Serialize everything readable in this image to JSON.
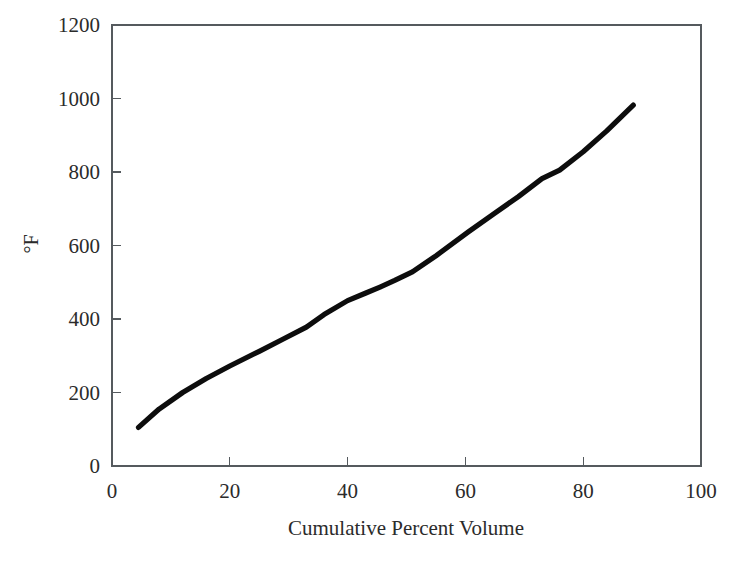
{
  "chart_data": {
    "type": "line",
    "title": "",
    "subtitle": "",
    "xlabel": "Cumulative Percent Volume",
    "ylabel": "°F",
    "xlim": [
      0,
      100
    ],
    "ylim": [
      0,
      1200
    ],
    "xticks": [
      0,
      20,
      40,
      60,
      80,
      100
    ],
    "yticks": [
      0,
      200,
      400,
      600,
      800,
      1000,
      1200
    ],
    "xtick_labels": [
      "0",
      "20",
      "40",
      "60",
      "80",
      "100"
    ],
    "ytick_labels": [
      "0",
      "200",
      "400",
      "600",
      "800",
      "1000",
      "1200"
    ],
    "grid": false,
    "legend": null,
    "series": [
      {
        "name": "Distillation curve",
        "color": "#0d0d0d",
        "line_width": 5,
        "x": [
          4.5,
          8.0,
          12.0,
          16.0,
          20.0,
          25.0,
          29.0,
          33.0,
          36.0,
          40.0,
          43.0,
          45.5,
          48.0,
          51.0,
          55.0,
          60.5,
          65.0,
          69.0,
          73.0,
          76.0,
          80.0,
          84.0,
          88.5
        ],
        "y": [
          105,
          155,
          200,
          238,
          272,
          312,
          345,
          378,
          412,
          450,
          470,
          487,
          505,
          528,
          572,
          637,
          688,
          733,
          782,
          805,
          855,
          912,
          982
        ]
      }
    ],
    "annotations": []
  },
  "axes": {
    "frame_color": "#555a5e",
    "background": "#ffffff",
    "tick_direction": "in"
  }
}
